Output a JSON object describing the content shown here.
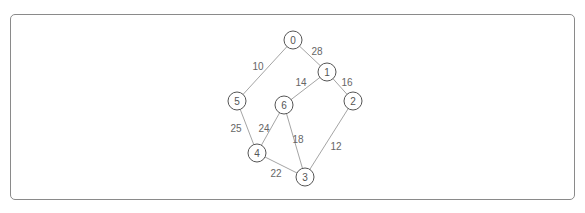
{
  "diagram": {
    "type": "weighted-undirected-graph",
    "nodes": [
      {
        "id": "0",
        "label": "0"
      },
      {
        "id": "1",
        "label": "1"
      },
      {
        "id": "2",
        "label": "2"
      },
      {
        "id": "3",
        "label": "3"
      },
      {
        "id": "4",
        "label": "4"
      },
      {
        "id": "5",
        "label": "5"
      },
      {
        "id": "6",
        "label": "6"
      }
    ],
    "edges": [
      {
        "from": "0",
        "to": "1",
        "weight": "28"
      },
      {
        "from": "0",
        "to": "5",
        "weight": "10"
      },
      {
        "from": "1",
        "to": "6",
        "weight": "14"
      },
      {
        "from": "1",
        "to": "2",
        "weight": "16"
      },
      {
        "from": "5",
        "to": "4",
        "weight": "25"
      },
      {
        "from": "6",
        "to": "4",
        "weight": "24"
      },
      {
        "from": "6",
        "to": "3",
        "weight": "18"
      },
      {
        "from": "2",
        "to": "3",
        "weight": "12"
      },
      {
        "from": "4",
        "to": "3",
        "weight": "22"
      }
    ]
  }
}
